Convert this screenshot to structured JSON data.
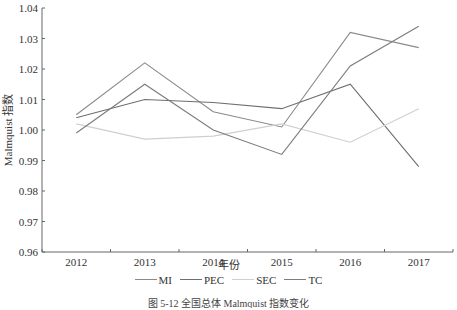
{
  "chart_data": {
    "type": "line",
    "title": "",
    "caption": "图 5-12 全国总体 Malmquist 指数变化",
    "xlabel": "年份",
    "ylabel": "Malmquist 指数",
    "categories": [
      "2012",
      "2013",
      "2014",
      "2015",
      "2016",
      "2017"
    ],
    "ylim": [
      0.96,
      1.04
    ],
    "yticks": [
      "0.96",
      "0.97",
      "0.98",
      "0.99",
      "1.00",
      "1.01",
      "1.02",
      "1.03",
      "1.04"
    ],
    "grid": false,
    "legend_position": "bottom",
    "series": [
      {
        "name": "MI",
        "color": "#8a8a8a",
        "values": [
          1.005,
          1.022,
          1.006,
          1.001,
          1.032,
          1.027
        ]
      },
      {
        "name": "PEC",
        "color": "#6e6e6e",
        "values": [
          1.004,
          1.01,
          1.009,
          1.007,
          1.015,
          0.988
        ]
      },
      {
        "name": "SEC",
        "color": "#cfcfcf",
        "values": [
          1.002,
          0.997,
          0.998,
          1.002,
          0.996,
          1.007
        ]
      },
      {
        "name": "TC",
        "color": "#7c7c7c",
        "values": [
          0.999,
          1.015,
          1.0,
          0.992,
          1.021,
          1.034
        ]
      }
    ]
  }
}
